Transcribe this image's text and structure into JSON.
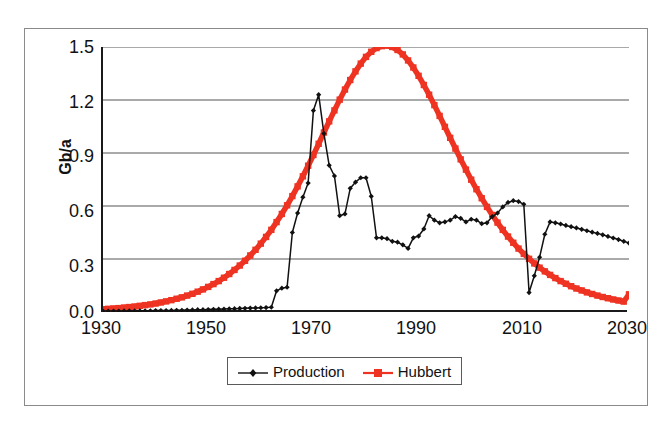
{
  "chart_data": {
    "type": "line",
    "title": "",
    "xlabel": "",
    "ylabel": "Gb/a",
    "xlim": [
      1930,
      2030
    ],
    "ylim": [
      0.0,
      1.5
    ],
    "grid": true,
    "grid_axis": "y",
    "legend_position": "bottom-center",
    "y_ticks": [
      "0.0",
      "0.3",
      "0.6",
      "0.9",
      "1.2",
      "1.5"
    ],
    "y_tick_values": [
      0.0,
      0.3,
      0.6,
      0.9,
      1.2,
      1.5
    ],
    "x_ticks": [
      "1930",
      "1950",
      "1970",
      "1990",
      "2010",
      "2030"
    ],
    "x_tick_values": [
      1930,
      1950,
      1970,
      1990,
      2010,
      2030
    ],
    "colors": {
      "production": "#111111",
      "hubbert": "#EE3322",
      "gridline": "#555555",
      "axis": "#1a1a1a",
      "frame": "#8a8a8a"
    },
    "series": [
      {
        "name": "Production",
        "color": "#111111",
        "marker": "diamond",
        "x": [
          1930,
          1931,
          1932,
          1933,
          1934,
          1935,
          1936,
          1937,
          1938,
          1939,
          1940,
          1941,
          1942,
          1943,
          1944,
          1945,
          1946,
          1947,
          1948,
          1949,
          1950,
          1951,
          1952,
          1953,
          1954,
          1955,
          1956,
          1957,
          1958,
          1959,
          1960,
          1961,
          1962,
          1963,
          1964,
          1965,
          1966,
          1967,
          1968,
          1969,
          1970,
          1971,
          1972,
          1973,
          1974,
          1975,
          1976,
          1977,
          1978,
          1979,
          1980,
          1981,
          1982,
          1983,
          1984,
          1985,
          1986,
          1987,
          1988,
          1989,
          1990,
          1991,
          1992,
          1993,
          1994,
          1995,
          1996,
          1997,
          1998,
          1999,
          2000,
          2001,
          2002,
          2003,
          2004,
          2005,
          2006,
          2007,
          2008,
          2009,
          2010,
          2011,
          2012,
          2013,
          2014,
          2015,
          2016,
          2017,
          2018,
          2019,
          2020,
          2021,
          2022,
          2023,
          2024,
          2025,
          2026,
          2027,
          2028,
          2029,
          2030
        ],
        "y": [
          0.005,
          0.005,
          0.005,
          0.005,
          0.006,
          0.006,
          0.006,
          0.007,
          0.007,
          0.007,
          0.008,
          0.008,
          0.008,
          0.009,
          0.01,
          0.01,
          0.011,
          0.012,
          0.013,
          0.013,
          0.014,
          0.015,
          0.016,
          0.017,
          0.018,
          0.019,
          0.02,
          0.021,
          0.022,
          0.023,
          0.024,
          0.025,
          0.027,
          0.12,
          0.135,
          0.14,
          0.45,
          0.56,
          0.65,
          0.73,
          1.14,
          1.23,
          1.01,
          0.83,
          0.77,
          0.545,
          0.555,
          0.7,
          0.735,
          0.76,
          0.76,
          0.655,
          0.42,
          0.42,
          0.415,
          0.4,
          0.395,
          0.38,
          0.36,
          0.42,
          0.43,
          0.47,
          0.545,
          0.52,
          0.505,
          0.51,
          0.52,
          0.54,
          0.53,
          0.51,
          0.525,
          0.52,
          0.5,
          0.505,
          0.54,
          0.56,
          0.595,
          0.62,
          0.63,
          0.625,
          0.61,
          0.11,
          0.205,
          0.31,
          0.44,
          0.51,
          0.505,
          0.498,
          0.49,
          0.483,
          0.476,
          0.468,
          0.46,
          0.452,
          0.445,
          0.437,
          0.428,
          0.419,
          0.41,
          0.4,
          0.39
        ]
      },
      {
        "name": "Hubbert",
        "color": "#EE3322",
        "marker": "square",
        "x": [
          1930,
          1931,
          1932,
          1933,
          1934,
          1935,
          1936,
          1937,
          1938,
          1939,
          1940,
          1941,
          1942,
          1943,
          1944,
          1945,
          1946,
          1947,
          1948,
          1949,
          1950,
          1951,
          1952,
          1953,
          1954,
          1955,
          1956,
          1957,
          1958,
          1959,
          1960,
          1961,
          1962,
          1963,
          1964,
          1965,
          1966,
          1967,
          1968,
          1969,
          1970,
          1971,
          1972,
          1973,
          1974,
          1975,
          1976,
          1977,
          1978,
          1979,
          1980,
          1981,
          1982,
          1983,
          1984,
          1985,
          1986,
          1987,
          1988,
          1989,
          1990,
          1991,
          1992,
          1993,
          1994,
          1995,
          1996,
          1997,
          1998,
          1999,
          2000,
          2001,
          2002,
          2003,
          2004,
          2005,
          2006,
          2007,
          2008,
          2009,
          2010,
          2011,
          2012,
          2013,
          2014,
          2015,
          2016,
          2017,
          2018,
          2019,
          2020,
          2021,
          2022,
          2023,
          2024,
          2025,
          2026,
          2027,
          2028,
          2029,
          2030
        ],
        "y": [
          0.016,
          0.018,
          0.02,
          0.022,
          0.025,
          0.028,
          0.031,
          0.035,
          0.039,
          0.043,
          0.048,
          0.054,
          0.06,
          0.067,
          0.075,
          0.083,
          0.093,
          0.103,
          0.115,
          0.128,
          0.142,
          0.158,
          0.175,
          0.194,
          0.215,
          0.238,
          0.263,
          0.29,
          0.32,
          0.352,
          0.387,
          0.425,
          0.465,
          0.509,
          0.555,
          0.604,
          0.656,
          0.711,
          0.768,
          0.828,
          0.889,
          0.952,
          1.016,
          1.079,
          1.141,
          1.202,
          1.259,
          1.313,
          1.362,
          1.406,
          1.444,
          1.473,
          1.494,
          1.505,
          1.508,
          1.5,
          1.483,
          1.458,
          1.424,
          1.384,
          1.337,
          1.285,
          1.23,
          1.171,
          1.11,
          1.048,
          0.986,
          0.925,
          0.864,
          0.806,
          0.749,
          0.695,
          0.644,
          0.595,
          0.549,
          0.506,
          0.465,
          0.427,
          0.392,
          0.359,
          0.329,
          0.301,
          0.275,
          0.251,
          0.23,
          0.21,
          0.192,
          0.175,
          0.16,
          0.146,
          0.133,
          0.122,
          0.111,
          0.102,
          0.093,
          0.085,
          0.078,
          0.071,
          0.065,
          0.059,
          0.1
        ]
      }
    ],
    "annotations": [
      {
        "text": "Production peak",
        "year": 1971,
        "value": 1.23
      },
      {
        "text": "Hubbert peak",
        "year": 1990,
        "value": 1.5
      },
      {
        "text": "Production collapse",
        "year": 2011,
        "value": 0.11
      }
    ]
  },
  "legend": {
    "entries": [
      {
        "label": "Production",
        "marker": "diamond-marker",
        "color": "#111111"
      },
      {
        "label": "Hubbert",
        "marker": "square-marker",
        "color": "#EE3322"
      }
    ]
  },
  "axes": {
    "ylabel": "Gb/a",
    "y_ticks": [
      "1.5",
      "1.2",
      "0.9",
      "0.6",
      "0.3",
      "0.0"
    ],
    "x_ticks": [
      "1930",
      "1950",
      "1970",
      "1990",
      "2010",
      "2030"
    ]
  }
}
